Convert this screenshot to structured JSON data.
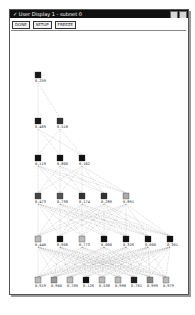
{
  "window": {
    "title": "✓ User Display 1 - subnet 0",
    "controls": [
      "minimize",
      "close"
    ]
  },
  "toolbar": {
    "buttons": [
      {
        "label": "DONE"
      },
      {
        "label": "SETUP"
      },
      {
        "label": "FREEZE"
      }
    ]
  },
  "network": {
    "layers": [
      {
        "y": 72,
        "nodes": [
          {
            "x": 35,
            "label": "0.259",
            "shade": "#1a1a1a"
          }
        ]
      },
      {
        "y": 118,
        "nodes": [
          {
            "x": 35,
            "label": "0.469",
            "shade": "#1a1a1a"
          },
          {
            "x": 57,
            "label": "0.518",
            "shade": "#333333"
          }
        ]
      },
      {
        "y": 155,
        "nodes": [
          {
            "x": 35,
            "label": "0.119",
            "shade": "#111111"
          },
          {
            "x": 57,
            "label": "0.800",
            "shade": "#111111"
          },
          {
            "x": 79,
            "label": "0.162",
            "shade": "#111111"
          }
        ]
      },
      {
        "y": 193,
        "nodes": [
          {
            "x": 35,
            "label": "0.473",
            "shade": "#444444"
          },
          {
            "x": 57,
            "label": "0.738",
            "shade": "#555555"
          },
          {
            "x": 79,
            "label": "0.174",
            "shade": "#333333"
          },
          {
            "x": 101,
            "label": "0.289",
            "shade": "#333333"
          },
          {
            "x": 123,
            "label": "0.891",
            "shade": "#aaaaaa"
          }
        ]
      },
      {
        "y": 236,
        "nodes": [
          {
            "x": 35,
            "label": "0.440",
            "shade": "#bbbbbb"
          },
          {
            "x": 57,
            "label": "0.906",
            "shade": "#111111"
          },
          {
            "x": 79,
            "label": "0.773",
            "shade": "#bbbbbb"
          },
          {
            "x": 101,
            "label": "0.000",
            "shade": "#111111"
          },
          {
            "x": 123,
            "label": "0.326",
            "shade": "#111111"
          },
          {
            "x": 145,
            "label": "0.000",
            "shade": "#111111"
          },
          {
            "x": 167,
            "label": "0.301",
            "shade": "#111111"
          }
        ]
      },
      {
        "y": 277,
        "nodes": [
          {
            "x": 35,
            "label": "0.919",
            "shade": "#bbbbbb"
          },
          {
            "x": 51,
            "label": "0.900",
            "shade": "#999999"
          },
          {
            "x": 67,
            "label": "0.709",
            "shade": "#bbbbbb"
          },
          {
            "x": 83,
            "label": "0.126",
            "shade": "#111111"
          },
          {
            "x": 99,
            "label": "0.538",
            "shade": "#bbbbbb"
          },
          {
            "x": 115,
            "label": "0.998",
            "shade": "#bbbbbb"
          },
          {
            "x": 131,
            "label": "0.701",
            "shade": "#222222"
          },
          {
            "x": 147,
            "label": "0.999",
            "shade": "#888888"
          },
          {
            "x": 163,
            "label": "0.979",
            "shade": "#bbbbbb"
          }
        ]
      }
    ]
  }
}
